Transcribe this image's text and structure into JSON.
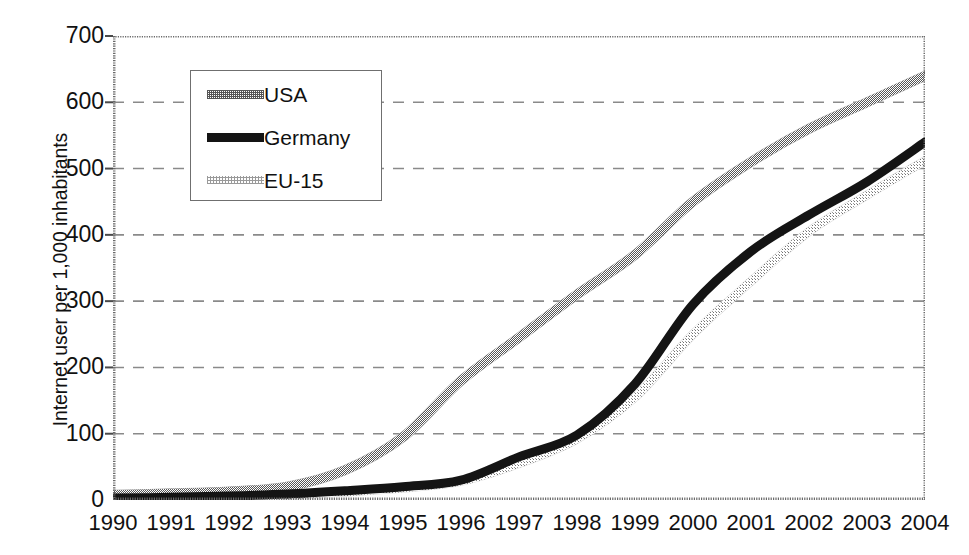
{
  "chart_data": {
    "type": "line",
    "title": "",
    "subtitle": "",
    "xlabel": "",
    "ylabel": "Internet user per 1,000 inhabitants",
    "x": [
      1990,
      1991,
      1992,
      1993,
      1994,
      1995,
      1996,
      1997,
      1998,
      1999,
      2000,
      2001,
      2002,
      2003,
      2004
    ],
    "xtick_labels": [
      "1990",
      "1991",
      "1992",
      "1993",
      "1994",
      "1995",
      "1996",
      "1997",
      "1998",
      "1999",
      "2000",
      "2001",
      "2002",
      "2003",
      "2004"
    ],
    "ytick_labels": [
      "0",
      "100",
      "200",
      "300",
      "400",
      "500",
      "600",
      "700"
    ],
    "yticks": [
      0,
      100,
      200,
      300,
      400,
      500,
      600,
      700
    ],
    "ylim": [
      0,
      700
    ],
    "xlim": [
      1990,
      2004
    ],
    "grid": "horizontal-dashed",
    "legend_position": "upper-left-inside",
    "series": [
      {
        "name": "USA",
        "color": "#8c8c8c",
        "style": "textured-medium",
        "values": [
          8,
          10,
          13,
          20,
          45,
          95,
          180,
          245,
          310,
          370,
          450,
          510,
          560,
          600,
          640
        ]
      },
      {
        "name": "Germany",
        "color": "#141414",
        "style": "solid-thick",
        "values": [
          3,
          4,
          6,
          9,
          14,
          20,
          30,
          65,
          98,
          175,
          295,
          375,
          430,
          480,
          540
        ]
      },
      {
        "name": "EU-15",
        "color": "#c2c2c2",
        "style": "textured-light",
        "values": [
          2,
          3,
          4,
          7,
          12,
          18,
          28,
          55,
          92,
          155,
          250,
          330,
          405,
          460,
          512
        ]
      }
    ]
  },
  "legend": {
    "items": [
      {
        "label": "USA"
      },
      {
        "label": "Germany"
      },
      {
        "label": "EU-15"
      }
    ]
  },
  "axes": {
    "y_title": "Internet user per 1,000 inhabitants"
  },
  "colors": {
    "usa": "#8c8c8c",
    "germany": "#141414",
    "eu15": "#c2c2c2",
    "axis": "#555555",
    "grid": "#8a8a8a",
    "background": "#ffffff"
  }
}
